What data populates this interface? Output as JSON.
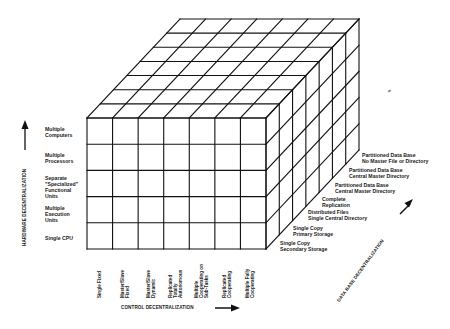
{
  "diagram": {
    "type": "3d-cube-matrix",
    "grid": {
      "columns": 7,
      "rows": 5,
      "depth": 7
    },
    "colors": {
      "line": "#111111",
      "background": "#ffffff"
    },
    "axes": {
      "hardware": {
        "title": "HARDWARE DECENTRALIZATION",
        "direction": "up",
        "arrow_icon": "arrow-up-icon",
        "levels": [
          "Single CPU",
          "Multiple\nExecution\nUnits",
          "Separate\n\"Specialized\"\nFunctional\nUnits",
          "Multiple\nProcessors",
          "Multiple\nComputers"
        ]
      },
      "control": {
        "title": "CONTROL DECENTRALIZATION",
        "direction": "right",
        "arrow_icon": "arrow-right-icon",
        "levels": [
          "Single Fixed",
          "Master/Slave\nFixed",
          "Master/Slave\nDynamic",
          "Replicated\nTotally\nAutonomous",
          "Multiple\nCooperating on\nSub-Tasks",
          "Replicated\nCooperating",
          "Multiple Fully\nCooperating"
        ]
      },
      "database": {
        "title": "DATA BASE DECENTRALIZATION",
        "direction": "back-right",
        "arrow_icon": "arrow-diagonal-up-right-icon",
        "levels": [
          "Single Copy\nSecondary Storage",
          "Single Copy\nPrimary Storage",
          "Distributed Files\nSingle Central Directory",
          "Complete\nReplication",
          "Partitioned Data Base\nCentral Master Directory",
          "Partitioned Data Base\nCentral Master Directory",
          "Partitioned Data Base\nNo Master File or Directory"
        ]
      }
    }
  }
}
